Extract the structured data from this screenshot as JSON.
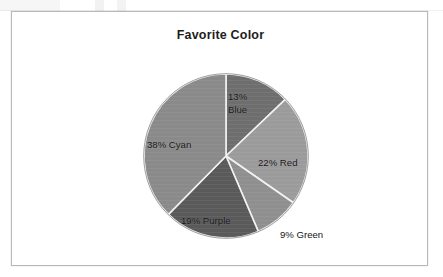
{
  "document": {
    "background_color": "#ffffff",
    "frame_border_color": "#b9b9b9"
  },
  "chart_data": {
    "type": "pie",
    "title": "Favorite Color",
    "subtitle": "",
    "xlabel": "",
    "ylabel": "",
    "legend_position": "none",
    "grid": false,
    "labels_inside_slices": true,
    "start_angle_deg": 0,
    "direction": "clockwise",
    "categories": [
      "Blue",
      "Red",
      "Green",
      "Purple",
      "Cyan"
    ],
    "values": [
      13,
      22,
      9,
      19,
      38
    ],
    "units": "percent",
    "total": 101,
    "slices": [
      {
        "name": "Blue",
        "value": 13,
        "label": "13% Blue",
        "label_line_1": "13%",
        "label_line_2": "Blue",
        "label_placement": "inside",
        "fill_color": "#6e6e6e",
        "start_angle_deg": 0,
        "end_angle_deg": 46.8
      },
      {
        "name": "Red",
        "value": 22,
        "label": "22% Red",
        "label_placement": "inside",
        "fill_color": "#9b9b9b",
        "start_angle_deg": 46.8,
        "end_angle_deg": 126.0
      },
      {
        "name": "Green",
        "value": 9,
        "label": "9% Green",
        "label_placement": "outside",
        "fill_color": "#8f8f8f",
        "start_angle_deg": 126.0,
        "end_angle_deg": 158.4
      },
      {
        "name": "Purple",
        "value": 19,
        "label": "19% Purple",
        "label_placement": "inside",
        "fill_color": "#5a5a5a",
        "start_angle_deg": 158.4,
        "end_angle_deg": 226.8
      },
      {
        "name": "Cyan",
        "value": 38,
        "label": "38% Cyan",
        "label_placement": "inside",
        "fill_color": "#8a8a8a",
        "start_angle_deg": 226.8,
        "end_angle_deg": 360.0
      }
    ],
    "slice_separator_color": "#f2f2f2",
    "pie_outline_color": "#777777",
    "center_x": 214,
    "center_y": 144,
    "radius": 82
  }
}
